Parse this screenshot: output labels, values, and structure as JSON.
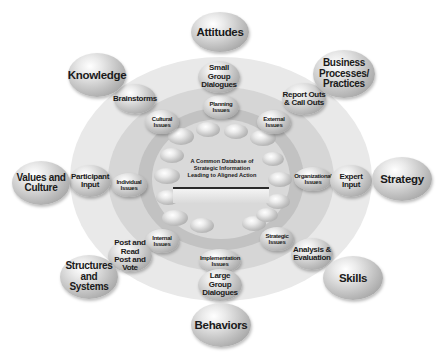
{
  "diagram": {
    "center": {
      "label": "A Common Database of Strategic Information Leading to Aligned Action",
      "lines": [
        "A Common Database of",
        "Strategic Information",
        "Leading to Aligned Action"
      ]
    },
    "outer_outcomes": [
      {
        "id": "attitudes",
        "lines": [
          "Attitudes"
        ]
      },
      {
        "id": "business-processes",
        "lines": [
          "Business",
          "Processes/",
          "Practices"
        ]
      },
      {
        "id": "strategy",
        "lines": [
          "Strategy"
        ]
      },
      {
        "id": "skills",
        "lines": [
          "Skills"
        ]
      },
      {
        "id": "behaviors",
        "lines": [
          "Behaviors"
        ]
      },
      {
        "id": "structures-systems",
        "lines": [
          "Structures",
          "and Systems"
        ]
      },
      {
        "id": "values-culture",
        "lines": [
          "Values and",
          "Culture"
        ]
      },
      {
        "id": "knowledge",
        "lines": [
          "Knowledge"
        ]
      }
    ],
    "methods_ring": [
      {
        "id": "small-group-dialogues",
        "lines": [
          "Small Group",
          "Dialogues"
        ]
      },
      {
        "id": "report-outs",
        "lines": [
          "Report Outs",
          "& Call Outs"
        ]
      },
      {
        "id": "expert-input",
        "lines": [
          "Expert Input"
        ]
      },
      {
        "id": "analysis-evaluation",
        "lines": [
          "Analysis &",
          "Evaluation"
        ]
      },
      {
        "id": "large-group-dialogues",
        "lines": [
          "Large Group",
          "Dialogues"
        ]
      },
      {
        "id": "post-read-vote",
        "lines": [
          "Post and Read",
          "Post and Vote"
        ]
      },
      {
        "id": "participant-input",
        "lines": [
          "Participant",
          "Input"
        ]
      },
      {
        "id": "brainstorms",
        "lines": [
          "Brainstorms"
        ]
      }
    ],
    "issues_ring": [
      {
        "id": "planning-issues",
        "lines": [
          "Planning",
          "Issues"
        ]
      },
      {
        "id": "external-issues",
        "lines": [
          "External",
          "Issues"
        ]
      },
      {
        "id": "organizational-issues",
        "lines": [
          "Organizational",
          "Issues"
        ]
      },
      {
        "id": "strategic-issues",
        "lines": [
          "Strategic",
          "Issues"
        ]
      },
      {
        "id": "implementation-issues",
        "lines": [
          "Implementation",
          "Issues"
        ]
      },
      {
        "id": "internal-issues",
        "lines": [
          "Internal",
          "Issues"
        ]
      },
      {
        "id": "individual-issues",
        "lines": [
          "Individual",
          "Issues"
        ]
      },
      {
        "id": "cultural-issues",
        "lines": [
          "Cultural",
          "Issues"
        ]
      }
    ]
  }
}
